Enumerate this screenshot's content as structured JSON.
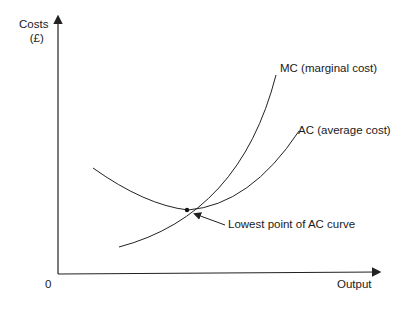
{
  "diagram": {
    "y_axis_label_line1": "Costs",
    "y_axis_label_line2": "(£)",
    "x_axis_label": "Output",
    "origin_label": "0",
    "curves": [
      {
        "id": "mc",
        "label": "MC (marginal cost)"
      },
      {
        "id": "ac",
        "label": "AC (average cost)"
      }
    ],
    "annotation": "Lowest point of AC curve",
    "line_color": "#222222"
  }
}
